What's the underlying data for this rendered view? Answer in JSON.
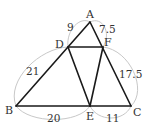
{
  "diagram": {
    "type": "geometry-triangle",
    "vertices": [
      {
        "id": "A",
        "label": "A",
        "x": 90,
        "y": 22
      },
      {
        "id": "B",
        "label": "B",
        "x": 16,
        "y": 106
      },
      {
        "id": "C",
        "label": "C",
        "x": 131,
        "y": 106
      },
      {
        "id": "D",
        "label": "D",
        "x": 68,
        "y": 47
      },
      {
        "id": "E",
        "label": "E",
        "x": 90,
        "y": 106
      },
      {
        "id": "F",
        "label": "F",
        "x": 103,
        "y": 47
      }
    ],
    "segments": [
      [
        "A",
        "B"
      ],
      [
        "A",
        "C"
      ],
      [
        "B",
        "C"
      ],
      [
        "D",
        "F"
      ],
      [
        "D",
        "E"
      ],
      [
        "E",
        "F"
      ]
    ],
    "measures": [
      {
        "segment": "AD",
        "label": "9"
      },
      {
        "segment": "AF",
        "label": "7.5"
      },
      {
        "segment": "DB",
        "label": "21"
      },
      {
        "segment": "FC",
        "label": "17.5"
      },
      {
        "segment": "BE",
        "label": "20"
      },
      {
        "segment": "EC",
        "label": "11"
      }
    ],
    "colors": {
      "edge": "#1a1a1a",
      "arc": "#c8c8c8",
      "text": "#333333"
    }
  }
}
